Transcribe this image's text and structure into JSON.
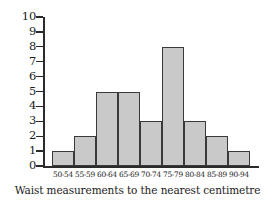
{
  "chart_data": {
    "type": "bar",
    "title": "",
    "subtitle": "",
    "xlabel": "Waist measurements to the nearest centimetre",
    "ylabel": "",
    "categories": [
      "50-54",
      "55-59",
      "60-64",
      "65-69",
      "70-74",
      "75-79",
      "80-84",
      "85-89",
      "90-94"
    ],
    "values": [
      1,
      2,
      5,
      5,
      3,
      8,
      3,
      2,
      1
    ],
    "ylim": [
      0,
      10
    ],
    "y_ticks": [
      0,
      1,
      2,
      3,
      4,
      5,
      6,
      7,
      8,
      9,
      10
    ],
    "y_tick_labels": [
      "0",
      "1",
      "2",
      "3",
      "4",
      "5",
      "6",
      "7",
      "8",
      "9",
      "10"
    ],
    "grid": false,
    "legend": false,
    "legend_position": "none",
    "bar_fill_color": "#c9c9c9",
    "bar_edge_color": "#3a3a3a",
    "axis_color": "#2b2b2b"
  },
  "axis": {
    "y_tick_labels": [
      "10",
      "9",
      "8",
      "7",
      "6",
      "5",
      "4",
      "3",
      "2",
      "1",
      "0"
    ]
  },
  "caption": {
    "text": "Waist measurements to the nearest centimetre"
  }
}
